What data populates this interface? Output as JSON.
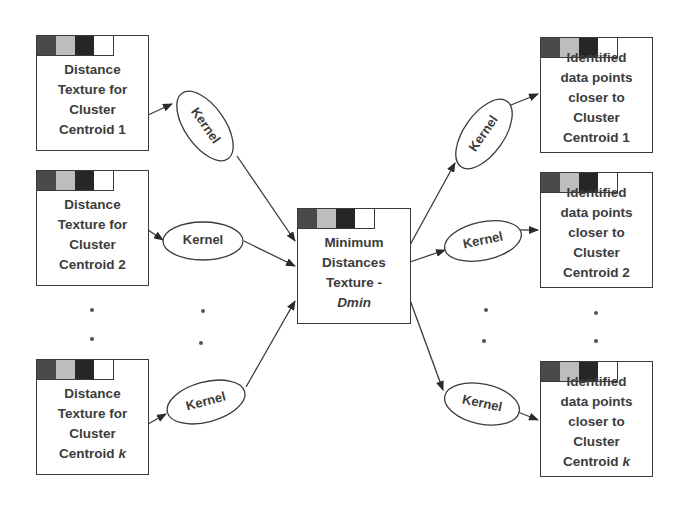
{
  "colors": {
    "swatch": [
      "#4a4a4a",
      "#bdbdbd",
      "#262626",
      "#ffffff"
    ],
    "stroke": "#3a3a3a",
    "text": "#3c3c3c"
  },
  "left": [
    {
      "lines": [
        "Distance",
        "Texture for",
        "Cluster",
        "Centroid 1"
      ]
    },
    {
      "lines": [
        "Distance",
        "Texture for",
        "Cluster",
        "Centroid 2"
      ]
    },
    {
      "lines": [
        "Distance",
        "Texture for",
        "Cluster",
        "Centroid",
        "k"
      ]
    }
  ],
  "center": {
    "lines": [
      "Minimum",
      "Distances",
      "Texture -",
      "Dmin"
    ]
  },
  "right": [
    {
      "lines": [
        "Identified",
        "data points",
        "closer to",
        "Cluster",
        "Centroid 1"
      ]
    },
    {
      "lines": [
        "Identified",
        "data points",
        "closer to",
        "Cluster",
        "Centroid 2"
      ]
    },
    {
      "lines": [
        "Identified",
        "data points",
        "closer to",
        "Cluster",
        "Centroid",
        "k"
      ]
    }
  ],
  "kernel_label": "Kernel"
}
